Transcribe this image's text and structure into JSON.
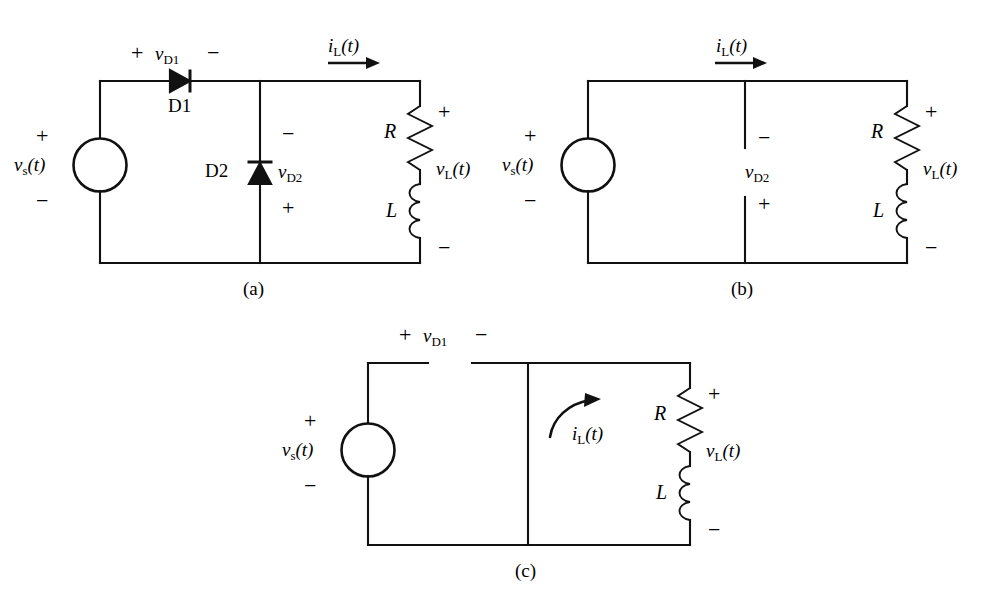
{
  "figure": {
    "type": "circuit-diagram",
    "title": "",
    "background_color": "#ffffff",
    "line_color": "#111111",
    "panels": [
      {
        "id": "a",
        "caption": "(a)",
        "source_label": "v_s(t)",
        "source_label_parts": {
          "base": "v",
          "sub": "s",
          "arg": "(t)"
        },
        "source_plus": "+",
        "source_minus": "−",
        "diode1_name": "D1",
        "diode1_voltage": "v_D1",
        "diode1_voltage_parts": {
          "base": "v",
          "sub": "D1"
        },
        "diode1_plus": "+",
        "diode1_minus": "−",
        "diode2_name": "D2",
        "diode2_voltage": "v_D2",
        "diode2_voltage_parts": {
          "base": "v",
          "sub": "D2"
        },
        "diode2_minus": "−",
        "diode2_plus": "+",
        "current_label": "i_L(t)",
        "current_label_parts": {
          "base": "i",
          "sub": "L",
          "arg": "(t)"
        },
        "resistor_label": "R",
        "inductor_label": "L",
        "load_voltage": "v_L(t)",
        "load_voltage_parts": {
          "base": "v",
          "sub": "L",
          "arg": "(t)"
        },
        "load_plus": "+",
        "load_minus": "−"
      },
      {
        "id": "b",
        "caption": "(b)",
        "source_label_parts": {
          "base": "v",
          "sub": "s",
          "arg": "(t)"
        },
        "source_plus": "+",
        "source_minus": "−",
        "diode2_voltage_parts": {
          "base": "v",
          "sub": "D2"
        },
        "diode2_minus": "−",
        "diode2_plus": "+",
        "current_label_parts": {
          "base": "i",
          "sub": "L",
          "arg": "(t)"
        },
        "resistor_label": "R",
        "inductor_label": "L",
        "load_voltage_parts": {
          "base": "v",
          "sub": "L",
          "arg": "(t)"
        },
        "load_plus": "+",
        "load_minus": "−"
      },
      {
        "id": "c",
        "caption": "(c)",
        "source_label_parts": {
          "base": "v",
          "sub": "s",
          "arg": "(t)"
        },
        "source_plus": "+",
        "source_minus": "−",
        "diode1_voltage_parts": {
          "base": "v",
          "sub": "D1"
        },
        "diode1_plus": "+",
        "diode1_minus": "−",
        "current_label_parts": {
          "base": "i",
          "sub": "L",
          "arg": "(t)"
        },
        "resistor_label": "R",
        "inductor_label": "L",
        "load_voltage_parts": {
          "base": "v",
          "sub": "L",
          "arg": "(t)"
        },
        "load_plus": "+",
        "load_minus": "−"
      }
    ]
  }
}
